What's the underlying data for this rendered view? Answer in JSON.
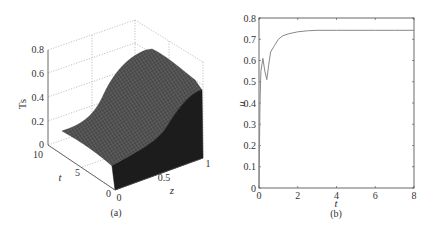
{
  "chart_data": [
    {
      "panel": "a",
      "type": "surface3d",
      "caption": "(a)",
      "title": "",
      "xlabel": "z",
      "ylabel": "t",
      "zlabel": "Ts",
      "x_ticks": [
        "0",
        "0.5",
        "1"
      ],
      "y_ticks": [
        "0",
        "5",
        "10"
      ],
      "z_ticks": [
        "0",
        "0.2",
        "0.4",
        "0.6",
        "0.8"
      ],
      "xlim": [
        0,
        1
      ],
      "ylim": [
        0,
        10
      ],
      "zlim": [
        0,
        0.8
      ],
      "grid": true,
      "description": "Ts rises sigmoidally along z from ~0.1 at z=0 to ~0.75 near z=0.7, dips slightly to ~0.7 at z=1; nearly constant along t except an initial transient near t=0",
      "z_profile": {
        "z": [
          0,
          0.1,
          0.2,
          0.3,
          0.4,
          0.5,
          0.6,
          0.7,
          0.8,
          0.9,
          1.0
        ],
        "Ts": [
          0.1,
          0.13,
          0.2,
          0.3,
          0.42,
          0.55,
          0.66,
          0.74,
          0.76,
          0.74,
          0.7
        ]
      }
    },
    {
      "panel": "b",
      "type": "line",
      "caption": "(b)",
      "title": "",
      "xlabel": "t",
      "ylabel": "u",
      "x_ticks": [
        "0",
        "2",
        "4",
        "6",
        "8"
      ],
      "y_ticks": [
        "0",
        "0.1",
        "0.2",
        "0.3",
        "0.4",
        "0.5",
        "0.6",
        "0.7",
        "0.8"
      ],
      "xlim": [
        0,
        8
      ],
      "ylim": [
        0,
        0.8
      ],
      "grid": false,
      "series": [
        {
          "name": "u",
          "x": [
            0,
            0.05,
            0.1,
            0.2,
            0.3,
            0.4,
            0.5,
            0.6,
            0.8,
            1.0,
            1.2,
            1.5,
            2.0,
            2.5,
            3.0,
            4.0,
            5.0,
            6.0,
            7.0,
            8.0
          ],
          "values": [
            0.0,
            0.4,
            0.55,
            0.61,
            0.55,
            0.51,
            0.58,
            0.64,
            0.67,
            0.7,
            0.715,
            0.725,
            0.735,
            0.74,
            0.742,
            0.742,
            0.742,
            0.742,
            0.742,
            0.742
          ]
        }
      ]
    }
  ]
}
